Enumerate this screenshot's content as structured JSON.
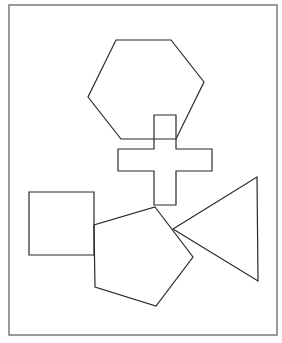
{
  "colors": {
    "background": "#ffffff",
    "frame": "#7a7a7a",
    "stroke": "#2a2a2a"
  },
  "frame": {
    "x": 9,
    "y": 5,
    "width": 268,
    "height": 330
  },
  "shapes": [
    {
      "name": "hexagon",
      "points": "116,40 171,40 204,82 176,139 121,139 88,97"
    },
    {
      "name": "cross",
      "points": "154,115 176,115 176,149 212,149 212,171 176,171 176,205 154,205 154,171 118,171 118,149 154,149"
    },
    {
      "name": "square",
      "points": "29,192 94,192 94,255 29,255"
    },
    {
      "name": "pentagon",
      "points": "155,207 193,257 156,306 95,287 94,225"
    },
    {
      "name": "triangle",
      "points": "173,229 257,177 258,281"
    }
  ]
}
